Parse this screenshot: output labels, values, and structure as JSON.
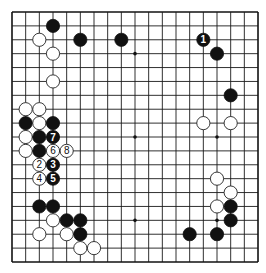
{
  "diagram": {
    "type": "go-board",
    "size": 19,
    "origin": {
      "x": 12,
      "y": 12
    },
    "cell": {
      "w": 13.667,
      "h": 13.889
    },
    "stone_radius": 6.6,
    "star_points": [
      [
        3,
        3
      ],
      [
        9,
        3
      ],
      [
        15,
        3
      ],
      [
        3,
        9
      ],
      [
        9,
        9
      ],
      [
        15,
        9
      ],
      [
        3,
        15
      ],
      [
        9,
        15
      ],
      [
        15,
        15
      ]
    ],
    "colors": {
      "black": "#111111",
      "white": "#ffffff",
      "line": "#1a1a1a"
    },
    "stones": [
      {
        "color": "black",
        "col": 3,
        "row": 1,
        "label": ""
      },
      {
        "color": "white",
        "col": 2,
        "row": 2,
        "label": ""
      },
      {
        "color": "black",
        "col": 5,
        "row": 2,
        "label": ""
      },
      {
        "color": "black",
        "col": 8,
        "row": 2,
        "label": ""
      },
      {
        "color": "white",
        "col": 3,
        "row": 3,
        "label": ""
      },
      {
        "color": "white",
        "col": 3,
        "row": 5,
        "label": ""
      },
      {
        "color": "white",
        "col": 1,
        "row": 7,
        "label": ""
      },
      {
        "color": "white",
        "col": 2,
        "row": 7,
        "label": ""
      },
      {
        "color": "black",
        "col": 1,
        "row": 8,
        "label": ""
      },
      {
        "color": "white",
        "col": 2,
        "row": 8,
        "label": ""
      },
      {
        "color": "black",
        "col": 3,
        "row": 8,
        "label": ""
      },
      {
        "color": "white",
        "col": 1,
        "row": 9,
        "label": ""
      },
      {
        "color": "black",
        "col": 2,
        "row": 9,
        "label": ""
      },
      {
        "color": "black",
        "col": 3,
        "row": 9,
        "label": "7"
      },
      {
        "color": "white",
        "col": 1,
        "row": 10,
        "label": ""
      },
      {
        "color": "black",
        "col": 2,
        "row": 10,
        "label": ""
      },
      {
        "color": "white",
        "col": 3,
        "row": 10,
        "label": "6"
      },
      {
        "color": "white",
        "col": 4,
        "row": 10,
        "label": "8"
      },
      {
        "color": "white",
        "col": 2,
        "row": 11,
        "label": "2"
      },
      {
        "color": "black",
        "col": 3,
        "row": 11,
        "label": "3"
      },
      {
        "color": "white",
        "col": 2,
        "row": 12,
        "label": "4"
      },
      {
        "color": "black",
        "col": 3,
        "row": 12,
        "label": "5"
      },
      {
        "color": "black",
        "col": 2,
        "row": 14,
        "label": ""
      },
      {
        "color": "black",
        "col": 3,
        "row": 14,
        "label": ""
      },
      {
        "color": "white",
        "col": 3,
        "row": 15,
        "label": ""
      },
      {
        "color": "black",
        "col": 4,
        "row": 15,
        "label": ""
      },
      {
        "color": "black",
        "col": 5,
        "row": 15,
        "label": ""
      },
      {
        "color": "white",
        "col": 2,
        "row": 16,
        "label": ""
      },
      {
        "color": "white",
        "col": 4,
        "row": 16,
        "label": ""
      },
      {
        "color": "black",
        "col": 5,
        "row": 16,
        "label": ""
      },
      {
        "color": "white",
        "col": 5,
        "row": 17,
        "label": ""
      },
      {
        "color": "white",
        "col": 6,
        "row": 17,
        "label": ""
      },
      {
        "color": "black",
        "col": 14,
        "row": 2,
        "label": "1"
      },
      {
        "color": "black",
        "col": 15,
        "row": 3,
        "label": ""
      },
      {
        "color": "black",
        "col": 16,
        "row": 6,
        "label": ""
      },
      {
        "color": "white",
        "col": 14,
        "row": 8,
        "label": ""
      },
      {
        "color": "white",
        "col": 16,
        "row": 8,
        "label": ""
      },
      {
        "color": "white",
        "col": 15,
        "row": 12,
        "label": ""
      },
      {
        "color": "white",
        "col": 16,
        "row": 13,
        "label": ""
      },
      {
        "color": "white",
        "col": 15,
        "row": 14,
        "label": ""
      },
      {
        "color": "black",
        "col": 16,
        "row": 14,
        "label": ""
      },
      {
        "color": "black",
        "col": 16,
        "row": 15,
        "label": ""
      },
      {
        "color": "black",
        "col": 13,
        "row": 16,
        "label": ""
      },
      {
        "color": "black",
        "col": 15,
        "row": 16,
        "label": ""
      }
    ]
  }
}
